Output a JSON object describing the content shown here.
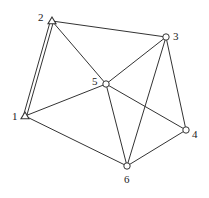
{
  "diagram": {
    "type": "graph",
    "nodes": [
      {
        "id": "1",
        "label": "1",
        "shape": "triangle",
        "x": 25,
        "y": 116,
        "label_x": 12,
        "label_y": 120
      },
      {
        "id": "2",
        "label": "2",
        "shape": "triangle",
        "x": 52,
        "y": 21,
        "label_x": 38,
        "label_y": 21
      },
      {
        "id": "3",
        "label": "3",
        "shape": "circle",
        "x": 166,
        "y": 37,
        "label_x": 173,
        "label_y": 40
      },
      {
        "id": "4",
        "label": "4",
        "shape": "circle",
        "x": 186,
        "y": 130,
        "label_x": 192,
        "label_y": 138
      },
      {
        "id": "5",
        "label": "5",
        "shape": "circle",
        "x": 106,
        "y": 84,
        "label_x": 92,
        "label_y": 85
      },
      {
        "id": "6",
        "label": "6",
        "shape": "circle",
        "x": 127,
        "y": 166,
        "label_x": 124,
        "label_y": 183
      }
    ],
    "edges": [
      {
        "from": "1",
        "to": "2",
        "style": "double"
      },
      {
        "from": "2",
        "to": "3",
        "style": "single"
      },
      {
        "from": "2",
        "to": "5",
        "style": "single"
      },
      {
        "from": "1",
        "to": "5",
        "style": "single"
      },
      {
        "from": "1",
        "to": "6",
        "style": "single"
      },
      {
        "from": "5",
        "to": "3",
        "style": "single"
      },
      {
        "from": "5",
        "to": "6",
        "style": "single"
      },
      {
        "from": "5",
        "to": "4",
        "style": "single"
      },
      {
        "from": "3",
        "to": "6",
        "style": "single"
      },
      {
        "from": "3",
        "to": "4",
        "style": "single"
      },
      {
        "from": "6",
        "to": "4",
        "style": "single"
      }
    ]
  }
}
